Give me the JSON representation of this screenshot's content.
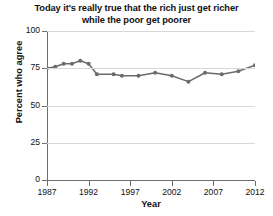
{
  "chart_data": {
    "type": "line",
    "title": "Today it's really true that the rich just get richer while the poor get poorer",
    "title_lines": [
      "Today it's really true that the rich just get richer",
      "while the poor get poorer"
    ],
    "xlabel": "Year",
    "ylabel": "Percent who agree",
    "xlim": [
      1987,
      2012
    ],
    "ylim": [
      0,
      100
    ],
    "yticks": [
      0,
      25,
      50,
      75,
      100
    ],
    "ytick_labels": [
      "0",
      "25",
      "50",
      "75",
      "100"
    ],
    "xticks": [
      1987,
      1992,
      1997,
      2002,
      2007,
      2012
    ],
    "xtick_labels": [
      "1987",
      "1992",
      "1997",
      "2002",
      "2007",
      "2012"
    ],
    "grid": true,
    "legend": "none",
    "line_color": "#6b6b6b",
    "marker": "circle",
    "x": [
      1987,
      1988,
      1989,
      1990,
      1991,
      1992,
      1993,
      1995,
      1996,
      1998,
      2000,
      2002,
      2004,
      2006,
      2008,
      2010,
      2012
    ],
    "values": [
      75,
      76,
      78,
      78,
      80,
      78,
      71,
      71,
      70,
      70,
      72,
      70,
      66,
      72,
      71,
      73,
      77
    ]
  }
}
